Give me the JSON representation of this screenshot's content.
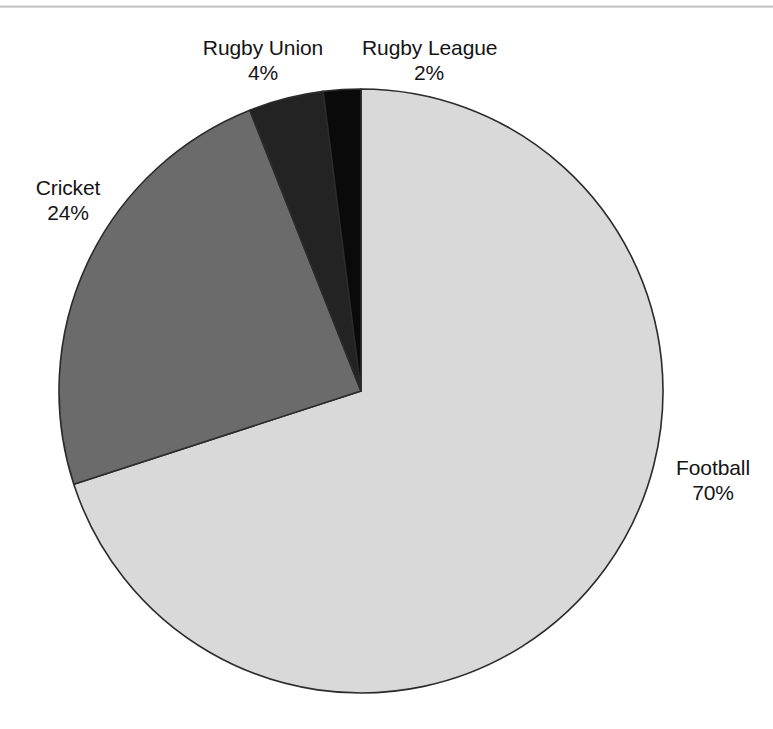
{
  "chart_data": {
    "type": "pie",
    "title": "",
    "subtitle": "",
    "xlabel": "",
    "ylabel": "",
    "grid": false,
    "legend_position": "none",
    "label_format": "name above percent",
    "start_angle_deg": 0,
    "direction": "clockwise",
    "categories": [
      "Football",
      "Cricket",
      "Rugby Union",
      "Rugby League"
    ],
    "values": [
      70,
      24,
      4,
      2
    ],
    "units": "%",
    "total": 100,
    "slices": [
      {
        "name": "Football",
        "value": 70,
        "value_label": "70%",
        "color": "#d9d9d9",
        "start_deg": 0,
        "end_deg": 252
      },
      {
        "name": "Cricket",
        "value": 24,
        "value_label": "24%",
        "color": "#6b6b6b",
        "start_deg": 252,
        "end_deg": 338.4
      },
      {
        "name": "Rugby Union",
        "value": 4,
        "value_label": "4%",
        "color": "#232323",
        "start_deg": 338.4,
        "end_deg": 352.8
      },
      {
        "name": "Rugby League",
        "value": 2,
        "value_label": "2%",
        "color": "#0a0a0a",
        "start_deg": 352.8,
        "end_deg": 360
      }
    ],
    "stroke_color": "#2b2b2b",
    "background_color": "#ffffff"
  },
  "labels": {
    "football": {
      "name": "Football",
      "value": "70%"
    },
    "cricket": {
      "name": "Cricket",
      "value": "24%"
    },
    "rugby_union": {
      "name": "Rugby Union",
      "value": "4%"
    },
    "rugby_league": {
      "name": "Rugby League",
      "value": "2%"
    }
  },
  "geometry": {
    "center_x": 361,
    "center_y": 391,
    "radius": 302
  }
}
